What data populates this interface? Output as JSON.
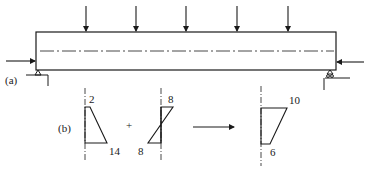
{
  "figure": {
    "part_a": {
      "label": "(a)",
      "description": "Simply supported beam under uniform transverse point loads and eccentric axial prestress",
      "load_count": 5
    },
    "part_b": {
      "label": "(b)",
      "diagram_1": {
        "top_value": "2",
        "bottom_value": "14"
      },
      "operator": "+",
      "diagram_2": {
        "top_value": "8",
        "bottom_value": "8"
      },
      "result": {
        "top_value": "10",
        "bottom_value": "6"
      }
    },
    "colors": {
      "line": "#1a1a1a",
      "background": "#ffffff"
    }
  }
}
